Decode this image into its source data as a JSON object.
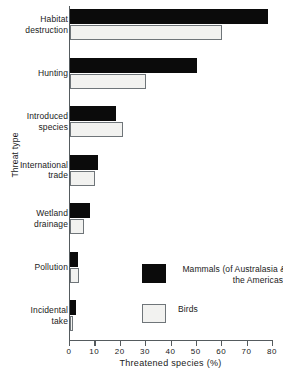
{
  "chart_data": {
    "type": "bar",
    "orientation": "horizontal",
    "title": "",
    "xlabel": "Threatened species (%)",
    "ylabel": "Threat type",
    "xlim": [
      0,
      80
    ],
    "xticks": [
      0,
      10,
      20,
      30,
      40,
      50,
      60,
      70,
      80
    ],
    "grid": false,
    "legend_position": "inside-lower-right",
    "categories": [
      "Habitat\ndestruction",
      "Hunting",
      "Introduced\nspecies",
      "International\ntrade",
      "Wetland\ndrainage",
      "Pollution",
      "Incidental\ntake"
    ],
    "series": [
      {
        "name": "Mammals (of Australasia &\nthe Americas)",
        "color": "#0b0b0b",
        "values": [
          78,
          50,
          18,
          11,
          8,
          3,
          2.5
        ]
      },
      {
        "name": "Birds",
        "color": "#f2f2f0",
        "values": [
          60,
          30,
          21,
          10,
          5.5,
          3.5,
          1
        ]
      }
    ]
  },
  "axis": {
    "x_label": "Threatened species (%)",
    "y_label": "Threat type",
    "tick_labels": [
      "0",
      "10",
      "20",
      "30",
      "40",
      "50",
      "60",
      "70",
      "80"
    ]
  },
  "legend": {
    "entries": [
      {
        "label": "Mammals (of Australasia &\nthe Americas)",
        "swatch": "black-filled-square"
      },
      {
        "label": "Birds",
        "swatch": "white-outlined-square"
      }
    ]
  },
  "categories": [
    {
      "label": "Habitat\ndestruction"
    },
    {
      "label": "Hunting"
    },
    {
      "label": "Introduced\nspecies"
    },
    {
      "label": "International\ntrade"
    },
    {
      "label": "Wetland\ndrainage"
    },
    {
      "label": "Pollution"
    },
    {
      "label": "Incidental\ntake"
    }
  ]
}
